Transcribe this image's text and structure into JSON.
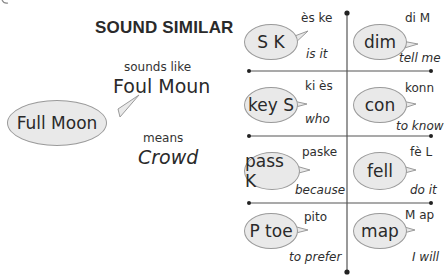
{
  "header": {
    "title": "SOUND SIMILAR"
  },
  "example": {
    "sounds_like_label": "sounds like",
    "sounds_like_value": "Foul Moun",
    "bubble_text": "Full Moon",
    "means_label": "means",
    "means_value": "Crowd"
  },
  "grid": {
    "cells": [
      {
        "bubble": "S K",
        "pronunciation": "ès ke",
        "meaning": "is it"
      },
      {
        "bubble": "dim",
        "pronunciation": "di M",
        "meaning": "tell me"
      },
      {
        "bubble": "key S",
        "pronunciation": "ki ès",
        "meaning": "who"
      },
      {
        "bubble": "con",
        "pronunciation": "konn",
        "meaning": "to know"
      },
      {
        "bubble": "pass K",
        "pronunciation": "paske",
        "meaning": "because"
      },
      {
        "bubble": "fell",
        "pronunciation": "fè L",
        "meaning": "do it"
      },
      {
        "bubble": "P toe",
        "pronunciation": "pito",
        "meaning": "to prefer"
      },
      {
        "bubble": "map",
        "pronunciation": "M ap",
        "meaning": "I will"
      }
    ]
  },
  "colors": {
    "bubble_fill": "#e9e9e9",
    "bubble_border": "#9a9a9a",
    "line": "#555555",
    "text": "#2a2a2a"
  }
}
